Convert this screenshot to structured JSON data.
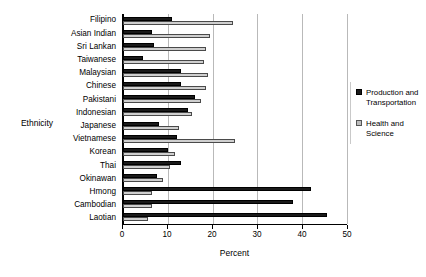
{
  "chart_data": {
    "type": "bar",
    "orientation": "horizontal",
    "title": "",
    "xlabel": "Percent",
    "ylabel": "Ethnicity",
    "xlim": [
      0,
      50
    ],
    "xticks": [
      0,
      10,
      20,
      30,
      40,
      50
    ],
    "grid": true,
    "legend_position": "right",
    "categories": [
      "Filipino",
      "Asian Indian",
      "Sri Lankan",
      "Taiwanese",
      "Malaysian",
      "Chinese",
      "Pakistani",
      "Indonesian",
      "Japanese",
      "Vietnamese",
      "Korean",
      "Thai",
      "Okinawan",
      "Hmong",
      "Cambodian",
      "Laotian"
    ],
    "series": [
      {
        "name": "Production and Transportation",
        "color": "#1a1a1a",
        "values": [
          11,
          6.5,
          7,
          4.5,
          13,
          13,
          16,
          14.5,
          8,
          12,
          10,
          13,
          7.5,
          42,
          38,
          45.5
        ]
      },
      {
        "name": "Health and Science",
        "color": "#cfcfcf",
        "values": [
          24.5,
          19.5,
          18.5,
          18,
          19,
          18.5,
          17.5,
          15.5,
          12.5,
          25,
          11.5,
          10.5,
          9,
          6.5,
          6.5,
          5.5
        ]
      }
    ]
  },
  "legend": {
    "entries": [
      {
        "label": "Production and Transportation"
      },
      {
        "label": "Health and Science"
      }
    ]
  }
}
